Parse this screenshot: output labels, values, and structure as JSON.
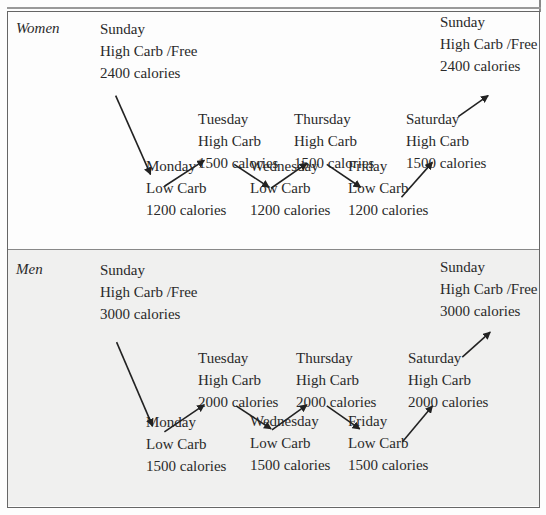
{
  "diagram": {
    "sections": [
      {
        "label": "Women",
        "nodes": {
          "sunday_start": {
            "day": "Sunday",
            "carb": "High Carb /Free",
            "calories": "2400 calories"
          },
          "monday": {
            "day": "Monday",
            "carb": "Low Carb",
            "calories": "1200 calories"
          },
          "tuesday": {
            "day": "Tuesday",
            "carb": "High Carb",
            "calories": "1500 calories"
          },
          "wednesday": {
            "day": "Wednesday",
            "carb": "Low Carb",
            "calories": "1200 calories"
          },
          "thursday": {
            "day": "Thursday",
            "carb": "High Carb",
            "calories": "1500 calories"
          },
          "friday": {
            "day": "Friday",
            "carb": "Low Carb",
            "calories": "1200 calories"
          },
          "saturday": {
            "day": "Saturday",
            "carb": "High Carb",
            "calories": "1500 calories"
          },
          "sunday_end": {
            "day": "Sunday",
            "carb": "High Carb /Free",
            "calories": "2400 calories"
          }
        }
      },
      {
        "label": "Men",
        "nodes": {
          "sunday_start": {
            "day": "Sunday",
            "carb": "High Carb /Free",
            "calories": "3000 calories"
          },
          "monday": {
            "day": "Monday",
            "carb": "Low Carb",
            "calories": "1500 calories"
          },
          "tuesday": {
            "day": "Tuesday",
            "carb": "High Carb",
            "calories": "2000 calories"
          },
          "wednesday": {
            "day": "Wednesday",
            "carb": "Low Carb",
            "calories": "1500 calories"
          },
          "thursday": {
            "day": "Thursday",
            "carb": "High Carb",
            "calories": "2000 calories"
          },
          "friday": {
            "day": "Friday",
            "carb": "Low Carb",
            "calories": "1500 calories"
          },
          "saturday": {
            "day": "Saturday",
            "carb": "High Carb",
            "calories": "2000 calories"
          },
          "sunday_end": {
            "day": "Sunday",
            "carb": "High Carb /Free",
            "calories": "3000 calories"
          }
        }
      }
    ]
  },
  "colors": {
    "women_bg": "#fdfdfd",
    "men_bg": "#f0f0ef",
    "border": "#666666",
    "text": "#2a2a2a"
  }
}
